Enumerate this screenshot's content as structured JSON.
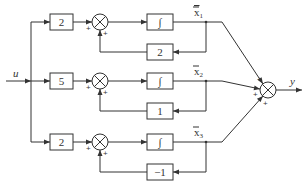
{
  "diagram": {
    "type": "block-diagram",
    "input": {
      "label": "u"
    },
    "output": {
      "label": "y"
    },
    "rows": [
      {
        "gain": "2",
        "integrator": "∫",
        "state_label": "x̄₁",
        "state_base": "x",
        "state_sub": "1",
        "feedback_gain": "2",
        "sum_signs": [
          "+",
          "+"
        ]
      },
      {
        "gain": "5",
        "integrator": "∫",
        "state_label": "x̄₂",
        "state_base": "x",
        "state_sub": "2",
        "feedback_gain": "1",
        "sum_signs": [
          "+",
          "+"
        ]
      },
      {
        "gain": "2",
        "integrator": "∫",
        "state_label": "x̄₃",
        "state_base": "x",
        "state_sub": "3",
        "feedback_gain": "−1",
        "sum_signs": [
          "+",
          "+"
        ]
      }
    ],
    "output_sum_signs": [
      "+",
      "+",
      "+"
    ]
  }
}
